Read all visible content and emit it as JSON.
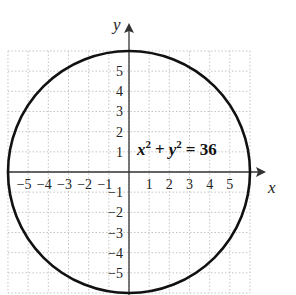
{
  "chart_data": {
    "type": "line",
    "title": "",
    "equation": "x² + y² = 36",
    "equation_parts": {
      "x": "x",
      "y": "y",
      "exp": "2",
      "plus": "+",
      "eq": "= 36"
    },
    "xlabel": "x",
    "ylabel": "y",
    "xlim": [
      -6,
      6
    ],
    "ylim": [
      -6,
      6
    ],
    "grid": true,
    "x_ticks": [
      "-5",
      "-4",
      "-3",
      "-2",
      "-1",
      "1",
      "2",
      "3",
      "4",
      "5"
    ],
    "y_ticks": [
      "5",
      "4",
      "3",
      "2",
      "1",
      "-1",
      "-2",
      "-3",
      "-4",
      "-5"
    ],
    "series": [
      {
        "name": "circle",
        "center": [
          0,
          0
        ],
        "radius": 6
      }
    ]
  },
  "colors": {
    "curve": "#111111",
    "grid": "#bbbbbb",
    "axis": "#333333"
  }
}
